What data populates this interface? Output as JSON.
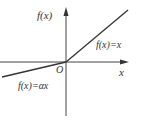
{
  "diagram": {
    "type": "function-graph",
    "axes": {
      "x_label": "x",
      "y_label": "f(x)",
      "origin_label": "O"
    },
    "pieces": [
      {
        "domain": "x >= 0",
        "label": "f(x)=x",
        "slope": 1
      },
      {
        "domain": "x < 0",
        "label": "f(x)=αx",
        "slope": "α (0<α<1)"
      }
    ],
    "colors": {
      "line": "#333333",
      "axis": "#444444",
      "background": "#ffffff"
    }
  }
}
